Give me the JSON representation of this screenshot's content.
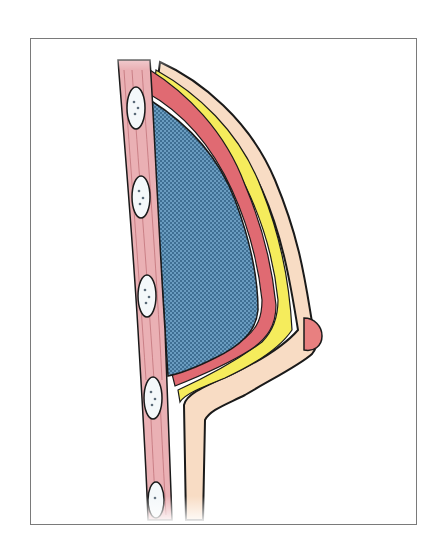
{
  "figure": {
    "caption": "",
    "layers": [
      {
        "name": "chest-wall-muscle",
        "color": "#eab0b4"
      },
      {
        "name": "ribs",
        "color": "#f4f8fa",
        "count": 5
      },
      {
        "name": "implant",
        "color": "#5f93b6"
      },
      {
        "name": "muscle-layer",
        "color": "#e06a72"
      },
      {
        "name": "fat-layer",
        "color": "#f5ec5c"
      },
      {
        "name": "skin",
        "color": "#f8dcc4"
      },
      {
        "name": "nipple",
        "color": "#e88080"
      }
    ],
    "colors": {
      "outline": "#1a1a1a",
      "frame": "#7a7a7a",
      "background": "#ffffff"
    }
  }
}
